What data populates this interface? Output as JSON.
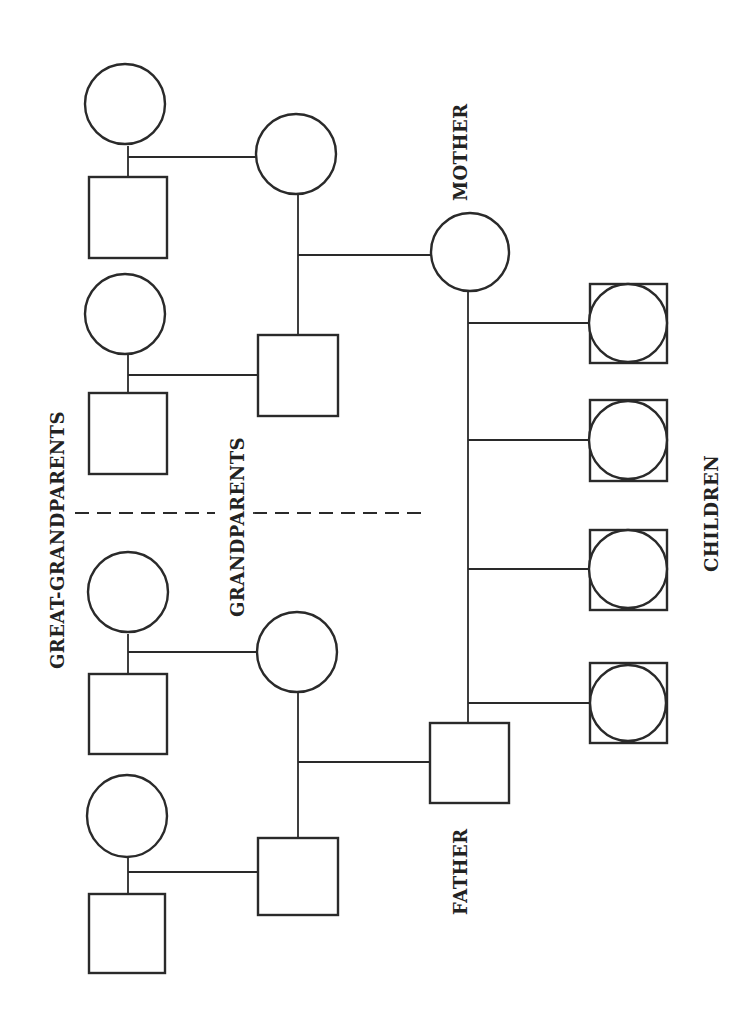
{
  "chart": {
    "title": "",
    "orientation": "rotated-90",
    "labels": {
      "great_grandparents": "GREAT-GRANDPARENTS",
      "grandparents": "GRANDPARENTS",
      "mother": "MOTHER",
      "father": "FATHER",
      "children": "CHILDREN"
    },
    "generations": [
      {
        "name": "Great-Grandparents",
        "members": [
          "circle",
          "square",
          "circle",
          "square",
          "circle",
          "square",
          "circle",
          "square"
        ]
      },
      {
        "name": "Grandparents",
        "members": [
          "circle",
          "square",
          "circle",
          "square"
        ]
      },
      {
        "name": "Parents",
        "members": [
          "Mother (circle)",
          "Father (square)"
        ]
      },
      {
        "name": "Children",
        "members": [
          "circle-in-square",
          "circle-in-square",
          "circle-in-square",
          "circle-in-square"
        ]
      }
    ],
    "colors": {
      "stroke": "#2a2a2a",
      "background": "#ffffff"
    }
  }
}
